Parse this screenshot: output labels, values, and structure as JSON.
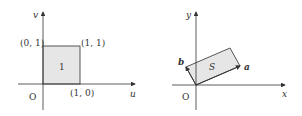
{
  "left_panel": {
    "axes": {
      "horizontal": "u",
      "vertical": "v",
      "origin": "O"
    },
    "square": {
      "label": "1",
      "fill": "#e6e6e6",
      "stroke": "#555555"
    },
    "points": [
      {
        "label": "(0, 1)"
      },
      {
        "label": "(1, 1)"
      },
      {
        "label": "(1, 0)"
      }
    ]
  },
  "right_panel": {
    "axes": {
      "horizontal": "x",
      "vertical": "y",
      "origin": "O"
    },
    "parallelogram": {
      "label": "S",
      "fill": "#e6e6e6",
      "stroke": "#555555"
    },
    "vectors": [
      {
        "label": "a"
      },
      {
        "label": "b"
      }
    ]
  }
}
